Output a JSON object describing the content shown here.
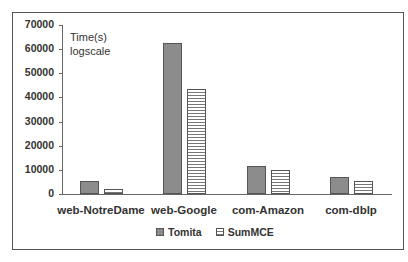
{
  "chart_data": {
    "type": "bar",
    "title": "",
    "xlabel": "",
    "ylabel": "",
    "annotation": [
      "Time(s)",
      "logscale"
    ],
    "categories": [
      "web-NotreDame",
      "web-Google",
      "com-Amazon",
      "com-dblp"
    ],
    "series": [
      {
        "name": "Tomita",
        "values": [
          5400,
          62600,
          11500,
          7200
        ],
        "color": "#8c8c8c",
        "pattern": "solid"
      },
      {
        "name": "SumMCE",
        "values": [
          2100,
          43300,
          10000,
          5500
        ],
        "color": "#ffffff",
        "pattern": "horizontal-stripes"
      }
    ],
    "ylim": [
      0,
      70000
    ],
    "yticks": [
      0,
      10000,
      20000,
      30000,
      40000,
      50000,
      60000,
      70000
    ],
    "ytick_labels": [
      "0",
      "10000",
      "20000",
      "30000",
      "40000",
      "50000",
      "60000",
      "70000"
    ],
    "grid": false,
    "legend_position": "bottom"
  }
}
